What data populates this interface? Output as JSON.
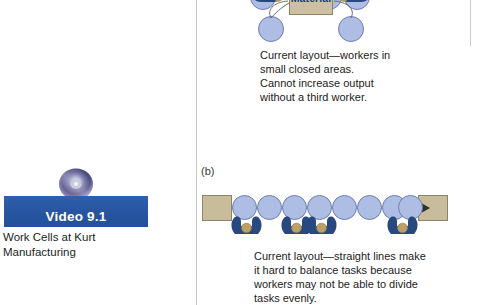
{
  "document": {
    "background_color": "#ffffff",
    "width": 490,
    "height": 305
  },
  "left_column": {
    "video_box": {
      "disc_icon_name": "cd-disc-icon",
      "banner_label": "Video 9.1",
      "banner_color": "#2c5aa8",
      "banner_text_color": "#ffffff",
      "caption_line1": "Work Cells at Kurt",
      "caption_line2": "Manufacturing",
      "caption_full": "Work Cells at Kurt Manufacturing"
    }
  },
  "right_column": {
    "figure_a": {
      "panel_tag": "",
      "material_box_label": "Material",
      "material_box_color": "#ccc0a0",
      "station_color": "#aebde4",
      "worker_color": "#27497f",
      "head_color": "#bba06a",
      "caption": "Current layout—workers in\nsmall closed areas.\nCannot increase output\nwithout a third worker.",
      "caption_lines": [
        "Current layout—workers in",
        "small closed areas.",
        "Cannot increase output",
        "without a third worker."
      ],
      "station_count": 6,
      "worker_count": 2
    },
    "figure_b": {
      "panel_tag": "(b)",
      "endbox_color": "#c9bc9b",
      "station_color": "#aebde4",
      "worker_color": "#27497f",
      "head_color": "#bba06a",
      "flow_arrow_name": "flow-arrow",
      "caption": "Current layout—straight lines make\nit hard to balance tasks because\nworkers may not be able to divide\ntasks evenly.",
      "caption_lines": [
        "Current layout—straight lines make",
        "it hard to balance tasks because",
        "workers may not be able to divide",
        "tasks evenly."
      ],
      "station_count": 8,
      "worker_count": 4
    }
  }
}
